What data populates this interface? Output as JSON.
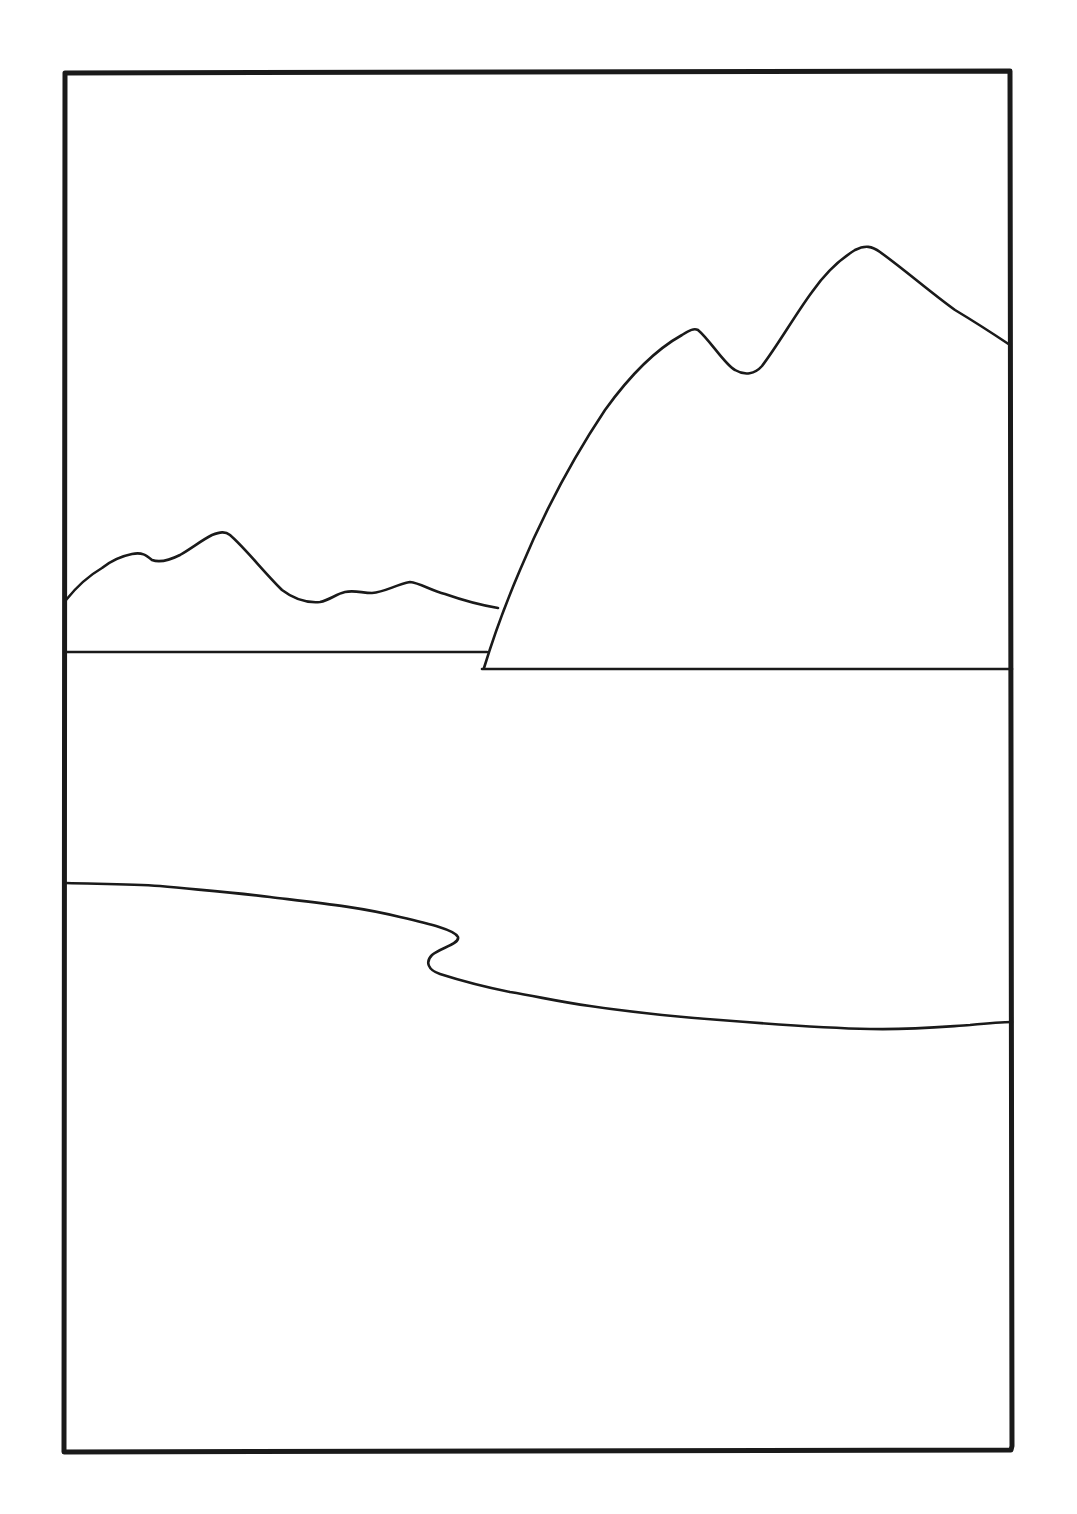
{
  "drawing": {
    "style": "black line art on white",
    "colors": {
      "background": "#ffffff",
      "ink": "#1a1a1a"
    },
    "frame": {
      "x1": 64,
      "y1": 72,
      "x2": 1012,
      "y2": 1451,
      "stroke_width": 5
    },
    "elements": [
      "picture-frame",
      "distant-mountain-range",
      "left-horizon-line",
      "foreground-mountain",
      "foreground-mountain-base-line",
      "shoreline"
    ]
  }
}
